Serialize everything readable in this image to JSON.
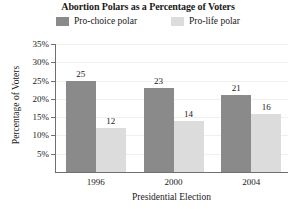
{
  "chart_data": {
    "type": "bar",
    "title": "Abortion Polars as a Percentage of Voters",
    "xlabel": "Presidential Election",
    "ylabel": "Percentage of Voters",
    "categories": [
      "1996",
      "2000",
      "2004"
    ],
    "series": [
      {
        "name": "Pro-choice polar",
        "values": [
          25,
          23,
          21
        ],
        "color": "#8a8a8a"
      },
      {
        "name": "Pro-life polar",
        "values": [
          12,
          14,
          16
        ],
        "color": "#dcdcdc"
      }
    ],
    "ylim": [
      0,
      35
    ],
    "ytick_labels": [
      "5%",
      "10%",
      "15%",
      "20%",
      "25%",
      "30%",
      "35%"
    ],
    "ytick_values": [
      5,
      10,
      15,
      20,
      25,
      30,
      35
    ],
    "grid": true,
    "legend_position": "top"
  },
  "legend": {
    "items": [
      {
        "label": "Pro-choice polar",
        "swatch": "legend-swatch-pro-choice"
      },
      {
        "label": "Pro-life polar",
        "swatch": "legend-swatch-pro-life"
      }
    ]
  },
  "colors": {
    "pro_choice": "#8a8a8a",
    "pro_life": "#dcdcdc",
    "axis": "#6f6f6f",
    "grid": "#f0f0f0",
    "text": "#1a1a1a"
  }
}
